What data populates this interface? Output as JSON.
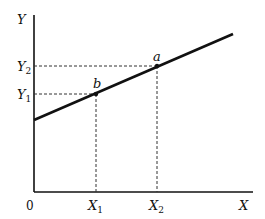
{
  "diagram": {
    "type": "linear-function-graph",
    "axes": {
      "x_label": "X",
      "y_label": "Y",
      "origin_label": "0"
    },
    "points": [
      {
        "name": "b",
        "x_label": "X",
        "x_sub": "1",
        "y_label": "Y",
        "y_sub": "1"
      },
      {
        "name": "a",
        "x_label": "X",
        "x_sub": "2",
        "y_label": "Y",
        "y_sub": "2"
      }
    ],
    "colors": {
      "line": "#111111",
      "axes": "#111111",
      "guides": "#333333"
    }
  }
}
